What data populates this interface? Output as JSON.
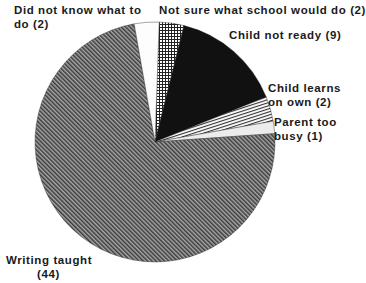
{
  "chart_data": {
    "type": "pie",
    "title": "",
    "total": 60,
    "start_angle_deg": 272,
    "direction": "clockwise",
    "slices": [
      {
        "key": "not_sure",
        "label": "Not sure what school would do (2)",
        "name": "Not sure what school would do",
        "value": 2,
        "pattern": "grid"
      },
      {
        "key": "not_ready",
        "label": "Child not ready (9)",
        "name": "Child not ready",
        "value": 9,
        "pattern": "solid-black"
      },
      {
        "key": "learns_own",
        "label": "Child learns on own (2)",
        "name": "Child learns on own",
        "value": 2,
        "pattern": "horizontal-lines"
      },
      {
        "key": "too_busy",
        "label": "Parent too busy (1)",
        "name": "Parent too busy",
        "value": 1,
        "pattern": "light-gray"
      },
      {
        "key": "writing",
        "label": "Writing taught (44)",
        "name": "Writing taught",
        "value": 44,
        "pattern": "diagonal-dense"
      },
      {
        "key": "did_not_know",
        "label": "Did not know what to do (2)",
        "name": "Did not know what to do",
        "value": 2,
        "pattern": "white"
      }
    ]
  },
  "labels": {
    "did_not_know": [
      "Did not know what to",
      "do (2)"
    ],
    "not_sure": [
      "Not sure what school would do (2)"
    ],
    "not_ready": [
      "Child not ready (9)"
    ],
    "learns_own": [
      "Child learns",
      "on own (2)"
    ],
    "too_busy": [
      "Parent too",
      "busy (1)"
    ],
    "writing": [
      "Writing taught",
      "(44)"
    ]
  },
  "colors": {
    "ink": "#111111",
    "diag_bg": "#9a9a9a",
    "light_gray": "#e8e8e8",
    "white": "#fdfdfd"
  }
}
